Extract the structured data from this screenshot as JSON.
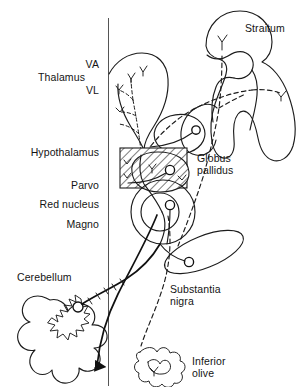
{
  "figure": {
    "kind": "neuroanatomy-circuit-diagram",
    "background_color": "#ffffff",
    "ink_color": "#1c1c1c",
    "midline_color": "#555555"
  },
  "labels": {
    "thalamus": "Thalamus",
    "va": "VA",
    "vl": "VL",
    "hypothalamus": "Hypothalamus",
    "parvo": "Parvo",
    "red_nucleus": "Red nucleus",
    "magno": "Magno",
    "cerebellum": "Cerebellum",
    "striatum": "Straitum",
    "globus_pallidus_line1": "Globus",
    "globus_pallidus_line2": "pallidus",
    "substantia_nigra_line1": "Substantia",
    "substantia_nigra_line2": "nigra",
    "inferior_olive_line1": "Inferior",
    "inferior_olive_line2": "olive"
  },
  "structures": [
    {
      "name": "striatum",
      "label": "Straitum",
      "style": "solid-outline"
    },
    {
      "name": "globus-pallidus",
      "label": "Globus pallidus",
      "style": "hatched-region"
    },
    {
      "name": "thalamus",
      "label": "Thalamus",
      "style": "solid-outline",
      "subdivisions": [
        "VA",
        "VL"
      ]
    },
    {
      "name": "hypothalamus",
      "label": "Hypothalamus",
      "style": "label-only"
    },
    {
      "name": "red-nucleus",
      "label": "Red nucleus",
      "style": "concentric-circles",
      "subdivisions": [
        "Parvo",
        "Magno"
      ]
    },
    {
      "name": "substantia-nigra",
      "label": "Substantia nigra",
      "style": "ellipse"
    },
    {
      "name": "cerebellum",
      "label": "Cerebellum",
      "style": "scalloped-outline",
      "contains": "dentate-nucleus"
    },
    {
      "name": "inferior-olive",
      "label": "Inferior olive",
      "style": "scalloped-cluster"
    }
  ],
  "pathways": [
    {
      "name": "nigrostriatal",
      "from": "substantia-nigra",
      "to": "striatum",
      "line": "dashed"
    },
    {
      "name": "pallidothalamic",
      "from": "globus-pallidus",
      "to": "thalamus",
      "line": "dashed"
    },
    {
      "name": "cerebellothalamic",
      "from": "cerebellum",
      "to": "thalamus",
      "line": "solid"
    },
    {
      "name": "rubro-olivary",
      "from": "red-nucleus-parvo",
      "to": "inferior-olive",
      "line": "dashed"
    },
    {
      "name": "rubrospinal",
      "from": "red-nucleus-magno",
      "to": "spinal-cord",
      "line": "solid-arrow"
    },
    {
      "name": "cerebello-rubral",
      "from": "dentate-nucleus",
      "to": "red-nucleus",
      "line": "solid"
    }
  ]
}
